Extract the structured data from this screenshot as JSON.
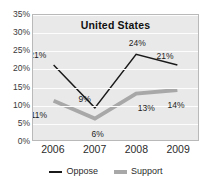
{
  "chart_data": {
    "type": "line",
    "title": "United States",
    "xlabel": "",
    "ylabel": "",
    "categories": [
      "2006",
      "2007",
      "2008",
      "2009"
    ],
    "ylim": [
      0,
      35
    ],
    "ytick_labels": [
      "0%",
      "5%",
      "10%",
      "15%",
      "20%",
      "25%",
      "30%",
      "35%"
    ],
    "ytick_values": [
      0,
      5,
      10,
      15,
      20,
      25,
      30,
      35
    ],
    "grid": true,
    "legend_position": "bottom",
    "series": [
      {
        "name": "Oppose",
        "color": "#1a1a1a",
        "line_width": 1.5,
        "values": [
          21,
          9,
          24,
          21
        ],
        "labels": [
          "21%",
          "9%",
          "24%",
          "21%"
        ]
      },
      {
        "name": "Support",
        "color": "#a8a8a8",
        "line_width": 4,
        "values": [
          11,
          6,
          13,
          14
        ],
        "labels": [
          "11%",
          "6%",
          "13%",
          "14%"
        ]
      }
    ],
    "plot_background": "#e9e9e9",
    "gridline_color": "#fdfdfd",
    "border_color": "#b9b9b9"
  }
}
